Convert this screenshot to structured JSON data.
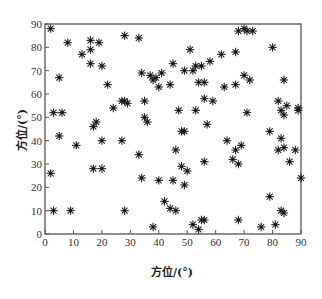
{
  "chart_data": {
    "type": "scatter",
    "title": "",
    "xlabel": "方位/(°)",
    "ylabel": "方位/(°)",
    "xlim": [
      0,
      90
    ],
    "ylim": [
      0,
      90
    ],
    "xticks": [
      0,
      10,
      20,
      30,
      40,
      50,
      60,
      70,
      80,
      90
    ],
    "yticks": [
      0,
      10,
      20,
      30,
      40,
      50,
      60,
      70,
      80,
      90
    ],
    "grid": false,
    "legend": null,
    "marker": "asterisk",
    "series": [
      {
        "name": "points",
        "points": [
          [
            2,
            88
          ],
          [
            8,
            82
          ],
          [
            13,
            77
          ],
          [
            16,
            83
          ],
          [
            19,
            82
          ],
          [
            16,
            79
          ],
          [
            16,
            73
          ],
          [
            20,
            72
          ],
          [
            5,
            67
          ],
          [
            22,
            64
          ],
          [
            24,
            54
          ],
          [
            28,
            85
          ],
          [
            33,
            84
          ],
          [
            27,
            57
          ],
          [
            28,
            57
          ],
          [
            29,
            56
          ],
          [
            34,
            69
          ],
          [
            35,
            57
          ],
          [
            35,
            50
          ],
          [
            36,
            48
          ],
          [
            38,
            66
          ],
          [
            39,
            67
          ],
          [
            41,
            69
          ],
          [
            40,
            63
          ],
          [
            37,
            68
          ],
          [
            3,
            52
          ],
          [
            6,
            52
          ],
          [
            5,
            42
          ],
          [
            11,
            38
          ],
          [
            18,
            48
          ],
          [
            17,
            46
          ],
          [
            20,
            40
          ],
          [
            27,
            40
          ],
          [
            33,
            34
          ],
          [
            34,
            24
          ],
          [
            2,
            26
          ],
          [
            17,
            28
          ],
          [
            20,
            28
          ],
          [
            3,
            10
          ],
          [
            9,
            10
          ],
          [
            28,
            10
          ],
          [
            38,
            3
          ],
          [
            48,
            44
          ],
          [
            44,
            64
          ],
          [
            45,
            73
          ],
          [
            51,
            79
          ],
          [
            49,
            70
          ],
          [
            52,
            70
          ],
          [
            53,
            72
          ],
          [
            55,
            72
          ],
          [
            54,
            65
          ],
          [
            56,
            65
          ],
          [
            58,
            74
          ],
          [
            62,
            77
          ],
          [
            67,
            78
          ],
          [
            68,
            87
          ],
          [
            70,
            88
          ],
          [
            71,
            87
          ],
          [
            73,
            87
          ],
          [
            67,
            64
          ],
          [
            63,
            63
          ],
          [
            56,
            58
          ],
          [
            47,
            53
          ],
          [
            53,
            53
          ],
          [
            57,
            47
          ],
          [
            59,
            57
          ],
          [
            70,
            68
          ],
          [
            72,
            66
          ],
          [
            80,
            80
          ],
          [
            84,
            66
          ],
          [
            82,
            57
          ],
          [
            83,
            53
          ],
          [
            84,
            51
          ],
          [
            85,
            55
          ],
          [
            89,
            54
          ],
          [
            89,
            53
          ],
          [
            71,
            52
          ],
          [
            64,
            40
          ],
          [
            69,
            38
          ],
          [
            67,
            36
          ],
          [
            66,
            32
          ],
          [
            68,
            30
          ],
          [
            83,
            41
          ],
          [
            84,
            37
          ],
          [
            88,
            36
          ],
          [
            86,
            31
          ],
          [
            90,
            24
          ],
          [
            79,
            44
          ],
          [
            82,
            36
          ],
          [
            56,
            31
          ],
          [
            46,
            36
          ],
          [
            48,
            29
          ],
          [
            50,
            27
          ],
          [
            45,
            23
          ],
          [
            40,
            23
          ],
          [
            44,
            11
          ],
          [
            42,
            14
          ],
          [
            46,
            10
          ],
          [
            49,
            21
          ],
          [
            52,
            4
          ],
          [
            54,
            2
          ],
          [
            55,
            6
          ],
          [
            56,
            6
          ],
          [
            68,
            6
          ],
          [
            76,
            3
          ],
          [
            79,
            16
          ],
          [
            83,
            10
          ],
          [
            84,
            9
          ],
          [
            81,
            4
          ],
          [
            49,
            44
          ]
        ]
      }
    ]
  }
}
